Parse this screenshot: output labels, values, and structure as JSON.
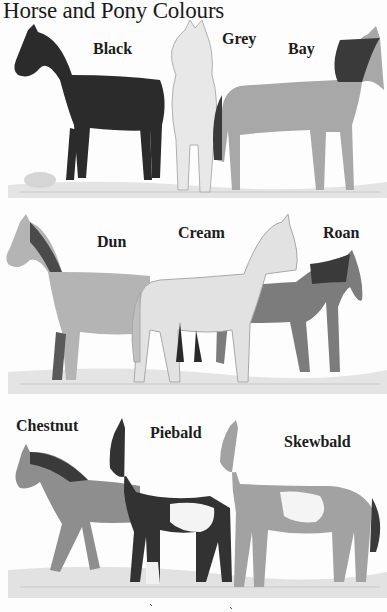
{
  "title": "Horse and Pony Colours",
  "panels": [
    {
      "row": 1,
      "horses": [
        {
          "label": "Black",
          "shade": "#2a2a2a"
        },
        {
          "label": "Grey",
          "shade": "#e6e6e6"
        },
        {
          "label": "Bay",
          "shade": "#a9a9a9"
        }
      ]
    },
    {
      "row": 2,
      "horses": [
        {
          "label": "Dun",
          "shade": "#b3b3b3"
        },
        {
          "label": "Cream",
          "shade": "#dedede"
        },
        {
          "label": "Roan",
          "shade": "#7a7a7a"
        }
      ]
    },
    {
      "row": 3,
      "horses": [
        {
          "label": "Chestnut",
          "shade": "#8c8c8c"
        },
        {
          "label": "Piebald",
          "shade": "#333333"
        },
        {
          "label": "Skewbald",
          "shade": "#a0a0a0"
        }
      ]
    }
  ]
}
